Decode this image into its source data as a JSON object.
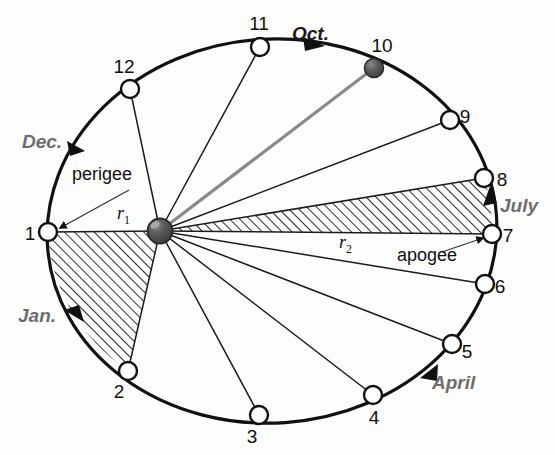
{
  "figure": {
    "center_body_name": "earth",
    "orbit": {
      "center_x": 272,
      "center_y": 231,
      "radius_x": 225,
      "radius_y": 192,
      "rotation_deg": -4
    },
    "focus": {
      "x": 160,
      "y": 231,
      "radius": 12
    }
  },
  "colors": {
    "orbit_stroke": "#111111",
    "radius_stroke": "#1c1c1c",
    "highlight_radius_stroke": "#8a8a8a",
    "hatch_stroke": "#222222",
    "node_fill": "#ffffff",
    "moon_fill": "#555555",
    "earth_fill": "#4a4a4a",
    "month_gray": "#6d6d6d",
    "month_dark": "#1a1a1a",
    "text_black": "#111111"
  },
  "orbit_points": [
    {
      "id": "1",
      "label": "1",
      "x": 48,
      "y": 232,
      "label_x": 30,
      "label_y": 240,
      "filled": false,
      "radius_style": "hidden"
    },
    {
      "id": "2",
      "label": "2",
      "x": 128,
      "y": 371,
      "label_x": 119,
      "label_y": 398,
      "filled": false,
      "radius_style": "normal"
    },
    {
      "id": "3",
      "label": "3",
      "x": 259,
      "y": 415,
      "label_x": 252,
      "label_y": 443,
      "filled": false,
      "radius_style": "normal"
    },
    {
      "id": "4",
      "label": "4",
      "x": 373,
      "y": 395,
      "label_x": 374,
      "label_y": 424,
      "filled": false,
      "radius_style": "normal"
    },
    {
      "id": "5",
      "label": "5",
      "x": 452,
      "y": 344,
      "label_x": 467,
      "label_y": 358,
      "filled": false,
      "radius_style": "normal"
    },
    {
      "id": "6",
      "label": "6",
      "x": 485,
      "y": 284,
      "label_x": 500,
      "label_y": 293,
      "filled": false,
      "radius_style": "normal"
    },
    {
      "id": "7",
      "label": "7",
      "x": 492,
      "y": 234,
      "label_x": 508,
      "label_y": 242,
      "filled": false,
      "radius_style": "hidden"
    },
    {
      "id": "8",
      "label": "8",
      "x": 484,
      "y": 178,
      "label_x": 502,
      "label_y": 186,
      "filled": false,
      "radius_style": "normal"
    },
    {
      "id": "9",
      "label": "9",
      "x": 450,
      "y": 120,
      "label_x": 465,
      "label_y": 123,
      "filled": false,
      "radius_style": "normal"
    },
    {
      "id": "10",
      "label": "10",
      "x": 374,
      "y": 68,
      "label_x": 371,
      "label_y": 52,
      "filled": true,
      "radius_style": "highlight"
    },
    {
      "id": "11",
      "label": "11",
      "x": 260,
      "y": 47,
      "label_x": 252,
      "label_y": 30,
      "filled": false,
      "radius_style": "normal"
    },
    {
      "id": "12",
      "label": "12",
      "x": 130,
      "y": 89,
      "label_x": 115,
      "label_y": 73,
      "filled": false,
      "radius_style": "normal"
    }
  ],
  "swept_sectors": [
    {
      "name": "perigee-sector",
      "from_point": "1",
      "to_point": "2",
      "hatched": true
    },
    {
      "name": "apogee-sector",
      "from_point": "7",
      "to_point": "8",
      "hatched": true
    }
  ],
  "month_labels": [
    {
      "name": "dec",
      "text": "Dec.",
      "x": 22,
      "y": 148,
      "tone": "gray"
    },
    {
      "name": "jan",
      "text": "Jan.",
      "x": 18,
      "y": 322,
      "tone": "gray"
    },
    {
      "name": "april",
      "text": "April",
      "x": 432,
      "y": 389,
      "tone": "gray"
    },
    {
      "name": "july",
      "text": "July",
      "x": 500,
      "y": 212,
      "tone": "gray"
    },
    {
      "name": "oct",
      "text": "Oct.",
      "x": 292,
      "y": 40,
      "tone": "dark"
    }
  ],
  "annotations": [
    {
      "name": "perigee",
      "text": "perigee",
      "x": 72,
      "y": 180
    },
    {
      "name": "apogee",
      "text": "apogee",
      "x": 397,
      "y": 261
    }
  ],
  "radius_labels": [
    {
      "name": "r1",
      "base": "r",
      "sub": "1",
      "x": 117,
      "y": 219
    },
    {
      "name": "r2",
      "base": "r",
      "sub": "2",
      "x": 339,
      "y": 248
    }
  ],
  "direction_arrows": [
    {
      "name": "arrow-dec",
      "at_point": "between-12-and-1"
    },
    {
      "name": "arrow-jan",
      "at_point": "between-1-and-2"
    },
    {
      "name": "arrow-april",
      "at_point": "between-4-and-5"
    },
    {
      "name": "arrow-july",
      "at_point": "between-7-and-8"
    },
    {
      "name": "arrow-oct",
      "at_point": "between-11-and-10"
    }
  ]
}
